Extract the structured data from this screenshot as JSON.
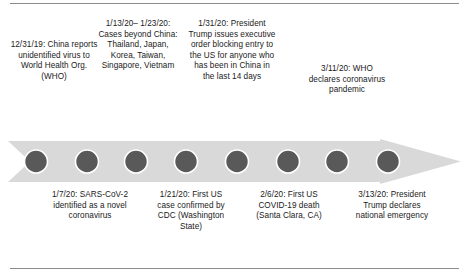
{
  "figure": {
    "colors": {
      "band_fill": "#d9d9d9",
      "marker_fill": "#595959",
      "marker_stroke": "#ffffff",
      "rule": "#8c8c8c",
      "text": "#1a1a1a",
      "background": "#ffffff"
    },
    "timeline": {
      "direction": "left-to-right",
      "marker_count": 8,
      "marker_shape": "circle"
    },
    "events_above": [
      {
        "date": "12/31/19:",
        "text": "China reports unidentified virus to World Health Org. (WHO)",
        "full": "12/31/19: China reports unidentified virus to World Health Org. (WHO)"
      },
      {
        "date": "1/13/20– 1/23/20:",
        "text": "Cases beyond China: Thailand, Japan, Korea, Taiwan, Singapore, Vietnam",
        "full": "1/13/20– 1/23/20: Cases beyond China: Thailand, Japan, Korea, Taiwan, Singapore, Vietnam"
      },
      {
        "date": "1/31/20:",
        "text": "President Trump issues executive order blocking entry to the US for anyone who has been in China in the last 14 days",
        "full": "1/31/20: President Trump issues executive order blocking entry to the US for anyone who has been in China in the last 14 days"
      },
      {
        "date": "3/11/20:",
        "text": "WHO declares coronavirus pandemic",
        "full": "3/11/20: WHO declares coronavirus pandemic"
      }
    ],
    "events_below": [
      {
        "date": "1/7/20:",
        "text": "SARS-CoV-2 identified as a novel coronavirus",
        "full": "1/7/20: SARS-CoV-2 identified as a novel coronavirus"
      },
      {
        "date": "1/21/20:",
        "text": "First US case confirmed by CDC (Washington State)",
        "full": "1/21/20: First US case confirmed by CDC (Washington State)"
      },
      {
        "date": "2/6/20:",
        "text": "First US COVID-19 death (Santa Clara, CA)",
        "full": "2/6/20: First US COVID-19 death (Santa Clara, CA)"
      },
      {
        "date": "3/13/20:",
        "text": "President Trump declares national emergency",
        "full": "3/13/20: President Trump declares national emergency"
      }
    ]
  }
}
